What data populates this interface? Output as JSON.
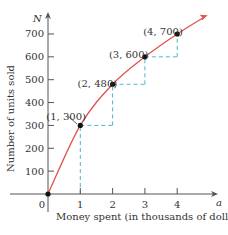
{
  "chart_data": {
    "type": "line",
    "title": "",
    "xlabel": "Money spent (in thousands of dollars)",
    "ylabel": "Number of units sold",
    "x_var": "a",
    "y_var": "N",
    "xlim": [
      0,
      5
    ],
    "ylim": [
      0,
      750
    ],
    "x_ticks": [
      "0",
      "1",
      "2",
      "3",
      "4"
    ],
    "y_ticks": [
      "100",
      "200",
      "300",
      "400",
      "500",
      "600",
      "700"
    ],
    "grid": false,
    "curve_color": "#e0524a",
    "dash_color": "#4fb6c9",
    "points": [
      {
        "x": 0,
        "y": 0,
        "label": ""
      },
      {
        "x": 1,
        "y": 300,
        "label": "(1, 300)"
      },
      {
        "x": 2,
        "y": 480,
        "label": "(2, 480)"
      },
      {
        "x": 3,
        "y": 600,
        "label": "(3, 600)"
      },
      {
        "x": 4,
        "y": 700,
        "label": "(4, 700)"
      }
    ]
  }
}
